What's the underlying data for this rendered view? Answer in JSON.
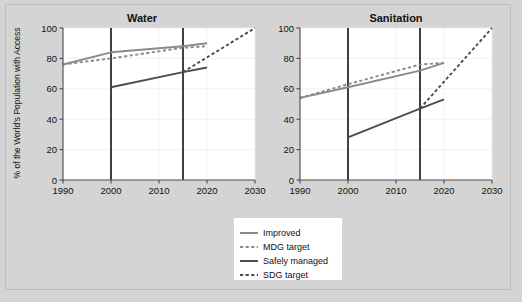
{
  "figure": {
    "background_color": "#d4d4d4",
    "panel_background_color": "#ffffff",
    "y_axis_title": "% of the World's Population with Access"
  },
  "legend": {
    "items": [
      {
        "label": "Improved",
        "style": "solid",
        "color": "#8a8a8a"
      },
      {
        "label": "MDG target",
        "style": "dashed",
        "color": "#8a8a8a"
      },
      {
        "label": "Safely managed",
        "style": "solid",
        "color": "#4d4d4d"
      },
      {
        "label": "SDG target",
        "style": "dashed",
        "color": "#4d4d4d"
      }
    ]
  },
  "chart_data": [
    {
      "type": "line",
      "title": "Water",
      "xlabel": "",
      "ylabel": "% of the World's Population with Access",
      "xlim": [
        1990,
        2030
      ],
      "ylim": [
        0,
        100
      ],
      "xticks": [
        1990,
        2000,
        2010,
        2020,
        2030
      ],
      "yticks": [
        0,
        20,
        40,
        60,
        80,
        100
      ],
      "grid": true,
      "legend_position": "below-right",
      "reference_lines": [
        2000,
        2015
      ],
      "series": [
        {
          "name": "Improved",
          "style": "solid",
          "color": "#8a8a8a",
          "x": [
            1990,
            2000,
            2015,
            2020
          ],
          "y": [
            76,
            84,
            88,
            90
          ]
        },
        {
          "name": "MDG target",
          "style": "dashed",
          "color": "#8a8a8a",
          "x": [
            1990,
            2000,
            2015,
            2020
          ],
          "y": [
            76,
            80,
            87,
            88
          ]
        },
        {
          "name": "Safely managed",
          "style": "solid",
          "color": "#4d4d4d",
          "x": [
            2000,
            2015,
            2020
          ],
          "y": [
            61,
            71,
            74
          ]
        },
        {
          "name": "SDG target",
          "style": "dashed",
          "color": "#4d4d4d",
          "x": [
            2015,
            2030
          ],
          "y": [
            71,
            100
          ]
        }
      ]
    },
    {
      "type": "line",
      "title": "Sanitation",
      "xlabel": "",
      "ylabel": "% of the World's Population with Access",
      "xlim": [
        1990,
        2030
      ],
      "ylim": [
        0,
        100
      ],
      "xticks": [
        1990,
        2000,
        2010,
        2020,
        2030
      ],
      "yticks": [
        0,
        20,
        40,
        60,
        80,
        100
      ],
      "grid": true,
      "legend_position": "below-right",
      "reference_lines": [
        2000,
        2015
      ],
      "series": [
        {
          "name": "Improved",
          "style": "solid",
          "color": "#8a8a8a",
          "x": [
            1990,
            2000,
            2015,
            2020
          ],
          "y": [
            54,
            61,
            72,
            77
          ]
        },
        {
          "name": "MDG target",
          "style": "dashed",
          "color": "#8a8a8a",
          "x": [
            1990,
            2000,
            2015,
            2020
          ],
          "y": [
            54,
            63,
            76,
            77
          ]
        },
        {
          "name": "Safely managed",
          "style": "solid",
          "color": "#4d4d4d",
          "x": [
            2000,
            2015,
            2020
          ],
          "y": [
            28,
            47,
            53
          ]
        },
        {
          "name": "SDG target",
          "style": "dashed",
          "color": "#4d4d4d",
          "x": [
            2015,
            2030
          ],
          "y": [
            47,
            100
          ]
        }
      ]
    }
  ]
}
